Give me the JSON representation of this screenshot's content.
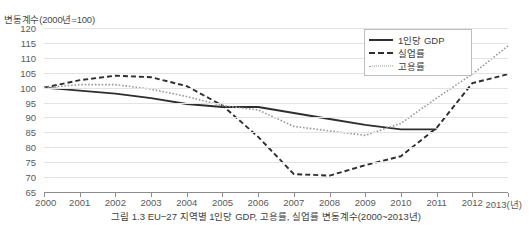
{
  "figure": {
    "axis_title": "변동계수(2000년=100)",
    "caption": "그림 1.3 EU−27 지역별 1인당 GDP, 고용률, 실업률 변동계수(2000~2013년)"
  },
  "legend": {
    "position": "top-right",
    "items": [
      {
        "label": "1인당 GDP",
        "style": "solid",
        "color": "#2e2e2e"
      },
      {
        "label": "실업률",
        "style": "dashed",
        "color": "#2e2e2e"
      },
      {
        "label": "고용률",
        "style": "dotted",
        "color": "#9a9a9a"
      }
    ]
  },
  "chart_data": {
    "type": "line",
    "title": "그림 1.3 EU−27 지역별 1인당 GDP, 고용률, 실업률 변동계수(2000~2013년)",
    "xlabel": "(년)",
    "ylabel": "변동계수(2000년=100)",
    "x": [
      2000,
      2001,
      2002,
      2003,
      2004,
      2005,
      2006,
      2007,
      2008,
      2009,
      2010,
      2011,
      2012,
      2013
    ],
    "xtick_labels": [
      "2000",
      "2001",
      "2002",
      "2003",
      "2004",
      "2005",
      "2006",
      "2007",
      "2008",
      "2009",
      "2010",
      "2011",
      "2012",
      "2013(년)"
    ],
    "ytick_labels": [
      "65",
      "70",
      "75",
      "80",
      "85",
      "90",
      "95",
      "100",
      "105",
      "110",
      "115",
      "120"
    ],
    "ylim": [
      65,
      120
    ],
    "ytick_step": 5,
    "xlim": [
      2000,
      2013
    ],
    "grid": "horizontal",
    "series": [
      {
        "name": "1인당 GDP",
        "style": "solid",
        "color": "#2e2e2e",
        "values": [
          100,
          99,
          98,
          96.5,
          94.5,
          93.5,
          93.5,
          91.5,
          89.5,
          87.5,
          86,
          86,
          null,
          null
        ]
      },
      {
        "name": "실업률",
        "style": "dashed",
        "color": "#2e2e2e",
        "values": [
          100,
          102.5,
          104,
          103.5,
          100.5,
          94,
          83.5,
          71,
          70.5,
          74,
          77,
          86.5,
          101.5,
          104.5
        ]
      },
      {
        "name": "고용률",
        "style": "dotted",
        "color": "#9a9a9a",
        "values": [
          100,
          101,
          101,
          99.5,
          97,
          94,
          92.5,
          87,
          85.5,
          84,
          88,
          96.5,
          104.5,
          114
        ]
      }
    ]
  }
}
